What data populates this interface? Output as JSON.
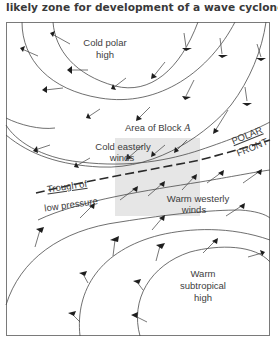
{
  "caption": "likely zone for development of a wave cyclone.",
  "diagram": {
    "frame": {
      "x": 6,
      "y": 22,
      "width": 264,
      "height": 314,
      "stroke": "#7a7a7a"
    },
    "shaded_block": {
      "x": 115,
      "y": 138,
      "width": 85,
      "height": 78,
      "fill": "#e6e6e6"
    },
    "labels": {
      "cold_polar_high_1": "Cold polar",
      "cold_polar_high_2": "high",
      "area_of_block": "Area of Block ",
      "area_of_block_letter": "A",
      "cold_easterly_1": "Cold easterly",
      "cold_easterly_2": "winds",
      "polar_front_1": "POLAR",
      "polar_front_2": "FRONT",
      "trough_1": "Trough of",
      "trough_2": "low pressure",
      "warm_westerly_1": "Warm westerly",
      "warm_westerly_2": "winds",
      "warm_subtropical_1": "Warm",
      "warm_subtropical_2": "subtropical",
      "warm_subtropical_3": "high"
    },
    "regions": [
      {
        "name": "Cold polar high",
        "position": "top-left"
      },
      {
        "name": "Cold easterly winds",
        "position": "north of polar front"
      },
      {
        "name": "Polar front / Trough of low pressure",
        "style": "dashed line"
      },
      {
        "name": "Warm westerly winds",
        "position": "south of polar front"
      },
      {
        "name": "Warm subtropical high",
        "position": "bottom-right"
      }
    ]
  }
}
